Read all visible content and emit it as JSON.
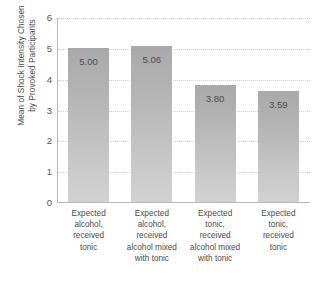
{
  "chart_data": {
    "type": "bar",
    "title": "",
    "xlabel": "",
    "ylabel": "Mean of Shock Intensity Chosen\nby Provoked Participants",
    "categories": [
      "Expected\nalcohol,\nreceived\ntonic",
      "Expected\nalcohol,\nreceived\nalcohol mixed\nwith tonic",
      "Expected\ntonic,\nreceived\nalcohol mixed\nwith tonic",
      "Expected\ntonic,\nreceived\ntonic"
    ],
    "values": [
      5.0,
      5.06,
      3.8,
      3.59
    ],
    "value_labels": [
      "5.00",
      "5.06",
      "3.80",
      "3.59"
    ],
    "ylim": [
      0,
      6
    ],
    "yticks": [
      0,
      1,
      2,
      3,
      4,
      5,
      6
    ],
    "ytick_labels": [
      "0",
      "1",
      "2",
      "3",
      "4",
      "5",
      "6"
    ],
    "grid": true,
    "grid_axis": "y",
    "legend": false,
    "bar_color": "#b4b4b4",
    "grid_color": "#cfcfcf",
    "axis_color": "#b9b9b9",
    "label_color": "#4a4a4a",
    "background": "#ffffff"
  }
}
